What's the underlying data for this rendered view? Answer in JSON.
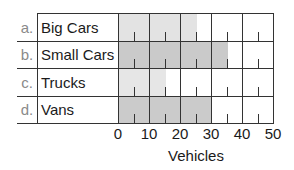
{
  "chart_data": {
    "type": "bar",
    "orientation": "horizontal",
    "title": "",
    "categories": [
      "Big Cars",
      "Small Cars",
      "Trucks",
      "Vans"
    ],
    "category_letters": [
      "a.",
      "b.",
      "c.",
      "d."
    ],
    "values": [
      25,
      35,
      15,
      30
    ],
    "bar_colors": [
      "#e3e3e3",
      "#cacaca",
      "#e6e6e6",
      "#cbcbcb"
    ],
    "xlabel": "Vehicles",
    "ylabel": "",
    "xlim": [
      0,
      50
    ],
    "x_ticks": [
      "0",
      "10",
      "20",
      "30",
      "40",
      "50"
    ],
    "grid": true,
    "minor_ticks": [
      5,
      15,
      25,
      35,
      45
    ]
  },
  "rows": [
    {
      "letter": "a.",
      "label": "Big Cars",
      "value": 25,
      "color": "#e3e3e3"
    },
    {
      "letter": "b.",
      "label": "Small Cars",
      "value": 35,
      "color": "#cacaca"
    },
    {
      "letter": "c.",
      "label": "Trucks",
      "value": 15,
      "color": "#e6e6e6"
    },
    {
      "letter": "d.",
      "label": "Vans",
      "value": 30,
      "color": "#cbcbcb"
    }
  ],
  "axis": {
    "ticks": [
      "0",
      "10",
      "20",
      "30",
      "40",
      "50"
    ],
    "label": "Vehicles"
  }
}
